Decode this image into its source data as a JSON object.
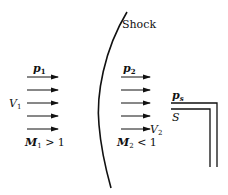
{
  "diagram": {
    "shock_label": "Shock",
    "upstream": {
      "pressure_label": "p",
      "pressure_sub": "1",
      "velocity_label": "V",
      "velocity_sub": "1",
      "mach_label": "M",
      "mach_sub": "1",
      "mach_relation": " > 1",
      "arrow_count": 5
    },
    "downstream": {
      "pressure_label": "p",
      "pressure_sub": "2",
      "velocity_label": "V",
      "velocity_sub": "2",
      "mach_label": "M",
      "mach_sub": "2",
      "mach_relation": " < 1",
      "arrow_count": 5
    },
    "pitot": {
      "pressure_label": "p",
      "pressure_sub": "s",
      "point_label": "S"
    },
    "colors": {
      "line": "#111111",
      "background": "#ffffff"
    }
  }
}
